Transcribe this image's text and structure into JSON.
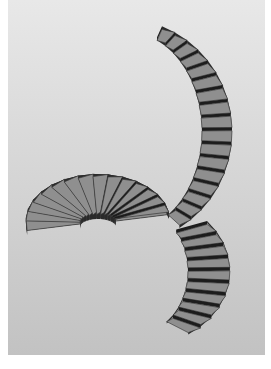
{
  "image": {
    "subject": "3D render of a curved spiral staircase with a loop",
    "background_gradient": {
      "top": "#e6e6e6",
      "bottom": "#c4c4c4"
    },
    "colors": {
      "tread": "#8f8f8f",
      "tread_edge": "#3a3a3a",
      "riser": "#1c1c1c",
      "side": "#2a2a2a"
    },
    "sections": {
      "upper_arc": {
        "step_count": 17
      },
      "loop": {
        "step_count": 30
      },
      "lower_tail": {
        "step_count": 10
      }
    }
  }
}
